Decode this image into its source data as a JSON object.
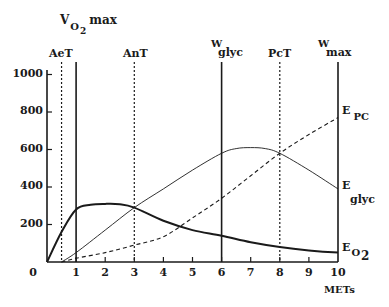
{
  "chart_data": {
    "type": "line",
    "title": "",
    "xlabel": "METs",
    "ylabel": "",
    "xlim": [
      0,
      10
    ],
    "ylim": [
      0,
      1000
    ],
    "grid": false,
    "x_ticks": [
      "0",
      "1",
      "2",
      "3",
      "4",
      "5",
      "6",
      "7",
      "8",
      "9",
      "10"
    ],
    "y_ticks": [
      "200",
      "400",
      "600",
      "800",
      "1000"
    ],
    "series": [
      {
        "name": "E O2",
        "label_main": "E",
        "label_sub": "O",
        "label_sub2": "2",
        "style": "thick-solid",
        "x": [
          0,
          0.5,
          1,
          1.5,
          2,
          2.5,
          3,
          4,
          5,
          6,
          7,
          8,
          9,
          10
        ],
        "values": [
          0,
          160,
          280,
          305,
          310,
          308,
          290,
          220,
          170,
          140,
          105,
          80,
          62,
          50
        ]
      },
      {
        "name": "E glyc",
        "label_main": "E",
        "label_sub": "glyc",
        "style": "thin-solid",
        "x": [
          0.5,
          1,
          2,
          3,
          4,
          5,
          6,
          6.5,
          7,
          7.5,
          8,
          9,
          10
        ],
        "values": [
          0,
          50,
          170,
          290,
          390,
          490,
          580,
          605,
          610,
          605,
          580,
          490,
          390
        ]
      },
      {
        "name": "E PC",
        "label_main": "E",
        "label_sub": "PC",
        "style": "dashed",
        "x": [
          0.5,
          1,
          2,
          3,
          4,
          5,
          6,
          7,
          8,
          9,
          10
        ],
        "values": [
          0,
          20,
          50,
          90,
          135,
          235,
          340,
          460,
          580,
          680,
          770
        ]
      }
    ],
    "vertical_markers": [
      {
        "name": "AeT",
        "label": "AeT",
        "x": 0.5,
        "style": "dotted"
      },
      {
        "name": "VO2max",
        "label_main": "V",
        "label_sub": "O",
        "label_sub2": "2",
        "label_suffix": "max",
        "x": 1,
        "style": "solid"
      },
      {
        "name": "AnT",
        "label": "AnT",
        "x": 3,
        "style": "dotted"
      },
      {
        "name": "Wglyc",
        "label_main": "W",
        "label_sub": "glyc",
        "x": 6,
        "style": "solid"
      },
      {
        "name": "PcT",
        "label": "PcT",
        "x": 8,
        "style": "dotted"
      },
      {
        "name": "Wmax",
        "label_main": "W",
        "label_sub": "max",
        "x": 10,
        "style": "solid"
      }
    ]
  },
  "labels": {
    "xlabel": "METs",
    "origin": "0",
    "vo2max": {
      "v": "V",
      "o": "O",
      "two": "2",
      "max": "max"
    },
    "aet": "AeT",
    "ant": "AnT",
    "wglyc": {
      "w": "W",
      "sub": "glyc"
    },
    "pct": "PcT",
    "wmax": {
      "w": "W",
      "sub": "max"
    },
    "epc": {
      "e": "E",
      "sub": "PC"
    },
    "eglyc": {
      "e": "E",
      "sub": "glyc"
    },
    "eo2": {
      "e": "E",
      "o": "O",
      "two": "2"
    }
  },
  "colors": {
    "ink": "#1a1a1a",
    "background": "#ffffff"
  }
}
